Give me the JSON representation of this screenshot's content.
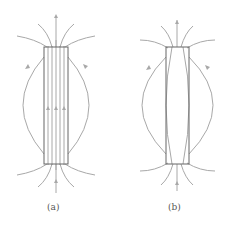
{
  "figure": {
    "panels": [
      {
        "id": "a",
        "label": "(a)",
        "description": "Field lines passing straight through an elongated rectangular body, with fanning lines at both ends and outer loops on each side"
      },
      {
        "id": "b",
        "label": "(b)",
        "description": "Field lines through an elongated rectangular body, with inner lines curving inward, fanning lines at the ends and outer loops on each side"
      }
    ],
    "colors": {
      "field_line": "#a8a8a8",
      "body_outline": "#666666",
      "background": "#ffffff",
      "label_text": "#555555"
    }
  }
}
